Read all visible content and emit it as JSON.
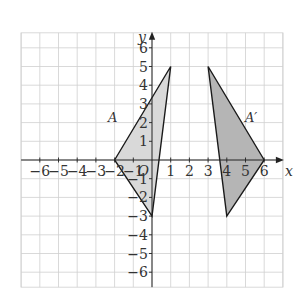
{
  "diagram": {
    "type": "coordinate-plane",
    "origin_px": [
      152,
      160
    ],
    "unit_px": 18.7,
    "grid": {
      "x_range": [
        -7,
        7
      ],
      "y_range": [
        -6.8,
        6.8
      ],
      "line_color": "#cfcfcf",
      "background": "#ffffff"
    },
    "axes": {
      "x_label": "x",
      "y_label": "y",
      "origin_label": "O",
      "x_ticks": [
        -6,
        -5,
        -4,
        -3,
        -2,
        -1,
        1,
        2,
        3,
        4,
        5,
        6
      ],
      "y_ticks": [
        -6,
        -5,
        -4,
        -3,
        -2,
        -1,
        1,
        2,
        3,
        4,
        5,
        6
      ],
      "color": "#222222"
    },
    "shapes": [
      {
        "name": "A",
        "label": "A",
        "vertices": [
          [
            -2,
            0
          ],
          [
            1,
            5
          ],
          [
            0,
            -3
          ]
        ],
        "fill": "#d9d9d9",
        "stroke": "#1a1a1a",
        "label_pos": [
          -2.1,
          2.3
        ]
      },
      {
        "name": "A-prime",
        "label": "A′",
        "vertices": [
          [
            6,
            0
          ],
          [
            3,
            5
          ],
          [
            4,
            -3
          ]
        ],
        "fill": "#b5b5b5",
        "stroke": "#1a1a1a",
        "label_pos": [
          5.3,
          2.3
        ]
      }
    ]
  }
}
